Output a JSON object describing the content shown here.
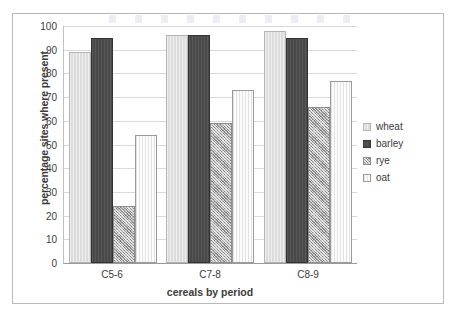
{
  "chart_data": {
    "type": "bar",
    "title": "",
    "xlabel": "cereals by period",
    "ylabel": "percentage sites where present",
    "categories": [
      "C5-6",
      "C7-8",
      "C8-9"
    ],
    "series": [
      {
        "name": "wheat",
        "values": [
          89,
          96,
          98
        ],
        "color": "#dcdcdc",
        "pattern": "light-solid"
      },
      {
        "name": "barley",
        "values": [
          95,
          96,
          95
        ],
        "color": "#494949",
        "pattern": "dark-solid"
      },
      {
        "name": "rye",
        "values": [
          24,
          59,
          66
        ],
        "color": "#a8a8a8",
        "pattern": "checkered"
      },
      {
        "name": "oat",
        "values": [
          54,
          73,
          77
        ],
        "color": "#fcfcfc",
        "pattern": "white-outline"
      }
    ],
    "ylim": [
      0,
      100
    ],
    "ytick_step": 10,
    "yticks": [
      100,
      90,
      80,
      70,
      60,
      50,
      40,
      30,
      20,
      10,
      0
    ],
    "grid": true,
    "grid_axis": "y",
    "legend_position": "right"
  },
  "legend": {
    "items": [
      {
        "label": "wheat"
      },
      {
        "label": "barley"
      },
      {
        "label": "rye"
      },
      {
        "label": "oat"
      }
    ]
  },
  "colors": {
    "frame_border": "#b8b8b8",
    "gridline": "#d9d9d9",
    "axis": "#9a9a9a",
    "text": "#3b3b3b"
  }
}
